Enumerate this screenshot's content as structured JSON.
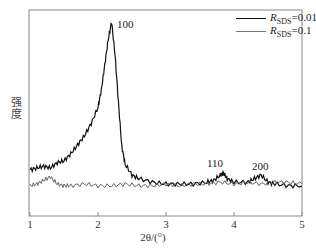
{
  "chart_data": {
    "type": "line",
    "title": "",
    "xlabel": "2θ/(°)",
    "ylabel": "强度",
    "xlim": [
      1,
      5
    ],
    "x_ticks": [
      "1",
      "2",
      "3",
      "4",
      "5"
    ],
    "y_ticks": [],
    "grid": false,
    "legend_position": "top-right",
    "series": [
      {
        "name": "R_SDS=0.01",
        "label_main": "R",
        "label_sub": "SDS",
        "label_value": "=0.01",
        "color": "#111111",
        "x": [
          1.0,
          1.1,
          1.2,
          1.3,
          1.4,
          1.5,
          1.6,
          1.7,
          1.8,
          1.9,
          2.0,
          2.05,
          2.1,
          2.15,
          2.2,
          2.25,
          2.3,
          2.35,
          2.4,
          2.5,
          2.6,
          2.8,
          3.0,
          3.2,
          3.4,
          3.6,
          3.7,
          3.8,
          3.85,
          3.9,
          4.0,
          4.2,
          4.3,
          4.4,
          4.5,
          4.6,
          4.8,
          5.0
        ],
        "y": [
          0.17,
          0.18,
          0.19,
          0.18,
          0.21,
          0.22,
          0.26,
          0.31,
          0.36,
          0.43,
          0.52,
          0.62,
          0.76,
          0.9,
          1.0,
          0.82,
          0.55,
          0.3,
          0.2,
          0.14,
          0.12,
          0.1,
          0.09,
          0.09,
          0.09,
          0.1,
          0.11,
          0.14,
          0.15,
          0.12,
          0.1,
          0.1,
          0.12,
          0.14,
          0.1,
          0.09,
          0.08,
          0.08
        ]
      },
      {
        "name": "R_SDS=0.1",
        "label_main": "R",
        "label_sub": "SDS",
        "label_value": "=0.1",
        "color": "#666666",
        "x": [
          1.0,
          1.1,
          1.2,
          1.3,
          1.4,
          1.5,
          1.6,
          1.8,
          2.0,
          2.2,
          2.4,
          2.6,
          2.8,
          3.0,
          3.2,
          3.4,
          3.6,
          3.8,
          4.0,
          4.2,
          4.4,
          4.6,
          4.8,
          5.0
        ],
        "y": [
          0.08,
          0.09,
          0.11,
          0.13,
          0.09,
          0.08,
          0.08,
          0.09,
          0.08,
          0.08,
          0.09,
          0.08,
          0.08,
          0.09,
          0.08,
          0.09,
          0.09,
          0.1,
          0.09,
          0.1,
          0.09,
          0.1,
          0.1,
          0.09
        ]
      }
    ],
    "annotations": [
      {
        "text": "100",
        "x": 2.2
      },
      {
        "text": "110",
        "x": 3.8
      },
      {
        "text": "200",
        "x": 4.4
      }
    ]
  }
}
